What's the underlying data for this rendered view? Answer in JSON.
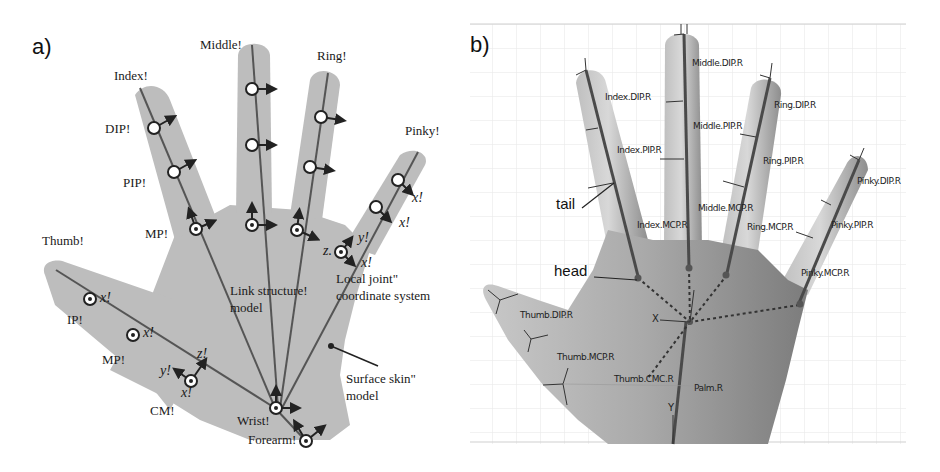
{
  "panel_a": {
    "tag": "a)",
    "fingers": {
      "thumb": "Thumb!",
      "index": "Index!",
      "middle": "Middle!",
      "ring": "Ring!",
      "pinky": "Pinky!"
    },
    "joints": {
      "dip": "DIP!",
      "pip": "PIP!",
      "mp_finger": "MP!",
      "ip": "IP!",
      "mp_thumb": "MP!",
      "cm": "CM!",
      "wrist": "Wrist!",
      "forearm": "Forearm!"
    },
    "axes": {
      "x": "x!",
      "y": "y!",
      "z": "z!",
      "z_short": "z."
    },
    "annotations": {
      "link_structure_line1": "Link structure!",
      "link_structure_line2": "model",
      "local_joint_line1": "Local joint\"",
      "local_joint_line2": "coordinate system",
      "surface_skin_line1": "Surface skin\"",
      "surface_skin_line2": "model"
    },
    "colors": {
      "hand_fill": "#b9b9b9",
      "bone_line": "#555555",
      "joint_fill": "#ffffff"
    }
  },
  "panel_b": {
    "tag": "b)",
    "annotations": {
      "tail": "tail",
      "head": "head"
    },
    "bones": {
      "index_dip": "Index.DIP.R",
      "index_pip": "Index.PIP.R",
      "index_mcp": "Index.MCP.R",
      "middle_dip": "Middle.DIP.R",
      "middle_pip": "Middle.PIP.R",
      "middle_mcp": "Middle.MCP.R",
      "ring_dip": "Ring.DIP.R",
      "ring_pip": "Ring.PIP.R",
      "ring_mcp": "Ring.MCP.R",
      "pinky_dip": "Pinky.DIP.R",
      "pinky_pip": "Pinky.PIP.R",
      "pinky_mcp": "Pinky.MCP.R",
      "thumb_dip": "Thumb.DIP.R",
      "thumb_mcp": "Thumb.MCP.R",
      "thumb_cmc": "Thumb.CMC.R",
      "palm": "Palm.R"
    },
    "axes": {
      "x": "X",
      "y": "Y"
    },
    "colors": {
      "skin_light": "#d6d6d6",
      "skin_dark": "#8a8a8a",
      "grid": "#e2e2e2",
      "bone": "#555555"
    }
  }
}
